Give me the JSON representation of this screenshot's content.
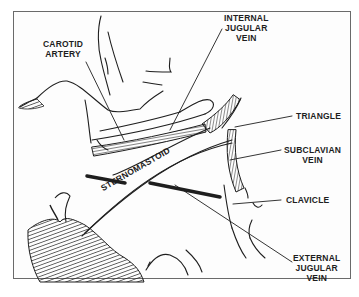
{
  "diagram": {
    "labels": {
      "carotid_artery": "CAROTID\nARTERY",
      "internal_jugular_vein": "INTERNAL\nJUGULAR\nVEIN",
      "triangle": "TRIANGLE",
      "subclavian_vein": "SUBCLAVIAN\nVEIN",
      "sternomastoid": "STERNOMASTOID",
      "clavicle": "CLAVICLE",
      "external_jugular_vein": "EXTERNAL\nJUGULAR\nVEIN"
    },
    "colors": {
      "ink": "#1e1e1e",
      "frame": "#6a6a6a",
      "background": "#ffffff"
    }
  }
}
